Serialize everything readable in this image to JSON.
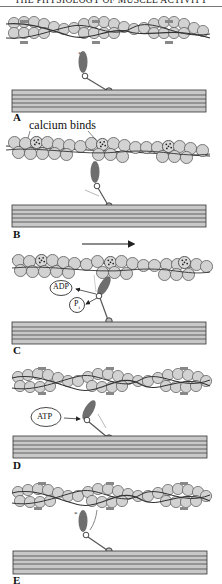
{
  "header": {
    "title": "THE PHYSIOLOGY OF MUSCLE ACTIVITY"
  },
  "colors": {
    "actin_fill": "#d2d2d2",
    "actin_stroke": "#444444",
    "myosin_head": "#6e6e6e",
    "thick_filament": "#c8c8c8",
    "line": "#333333"
  },
  "panels": [
    {
      "id": "A",
      "label": "A",
      "description": "Myosin head cocked, actin binding sites blocked by tropomyosin"
    },
    {
      "id": "B",
      "label": "B",
      "annotation": "calcium binds",
      "description": "Calcium binds troponin, exposing binding sites; myosin head attaches"
    },
    {
      "id": "C",
      "label": "C",
      "molecules": [
        "ADP",
        "P"
      ],
      "description": "Power stroke; ADP and Pi released; actin slides (arrow right)"
    },
    {
      "id": "D",
      "label": "D",
      "molecules": [
        "ATP"
      ],
      "description": "ATP binds, myosin head detaches"
    },
    {
      "id": "E",
      "label": "E",
      "description": "ATP hydrolysis re-cocks myosin head"
    }
  ],
  "labels": {
    "A": "A",
    "B": "B",
    "C": "C",
    "D": "D",
    "E": "E",
    "calcium": "calcium binds",
    "adp": "ADP",
    "p": "P",
    "p_sub": "i",
    "atp": "ATP",
    "star": "*"
  }
}
